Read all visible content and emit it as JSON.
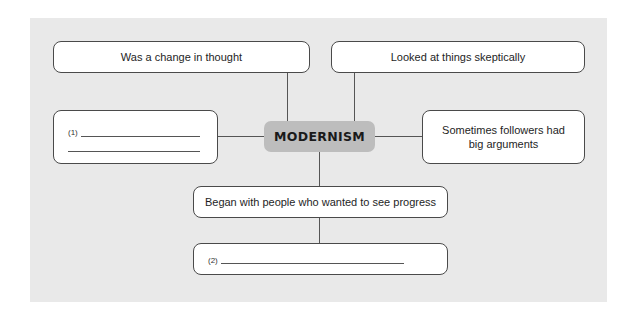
{
  "diagram": {
    "type": "concept-map",
    "center": {
      "label": "MODERNISM"
    },
    "nodes": [
      {
        "id": "top-left",
        "label": "Was a change in thought"
      },
      {
        "id": "top-right",
        "label": "Looked at things skeptically"
      },
      {
        "id": "left",
        "label": "(1)",
        "blank": true
      },
      {
        "id": "right",
        "label": "Sometimes followers had big arguments"
      },
      {
        "id": "bottom-1",
        "label": "Began with people who wanted to see progress"
      },
      {
        "id": "bottom-2",
        "label": "(2)",
        "blank": true
      }
    ],
    "edges": [
      [
        "center",
        "top-left"
      ],
      [
        "center",
        "top-right"
      ],
      [
        "center",
        "left"
      ],
      [
        "center",
        "right"
      ],
      [
        "center",
        "bottom-1"
      ],
      [
        "bottom-1",
        "bottom-2"
      ]
    ]
  },
  "colors": {
    "panel": "#e9e9e9",
    "center_fill": "#bdbdbd",
    "box_border": "#4a4a4a"
  }
}
